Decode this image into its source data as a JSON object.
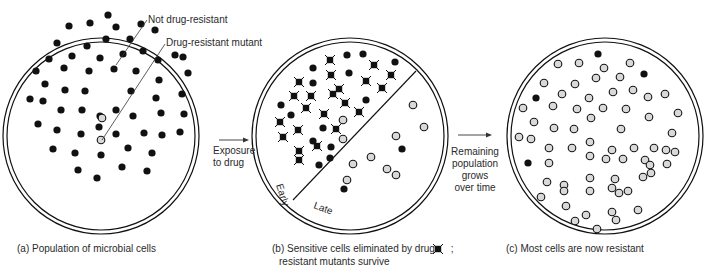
{
  "figure": {
    "panels": [
      {
        "id": "a",
        "caption": "(a) Population of microbial cells",
        "annotations": {
          "not_resistant": "Not drug-resistant",
          "resistant_mutant": "Drug-resistant mutant"
        },
        "center": [
          101,
          136
        ],
        "black_cells": [
          [
            108,
            15
          ],
          [
            69,
            26
          ],
          [
            90,
            23
          ],
          [
            116,
            27
          ],
          [
            141,
            24
          ],
          [
            155,
            30
          ],
          [
            57,
            43
          ],
          [
            87,
            46
          ],
          [
            106,
            39
          ],
          [
            130,
            39
          ],
          [
            49,
            59
          ],
          [
            72,
            56
          ],
          [
            100,
            58
          ],
          [
            123,
            54
          ],
          [
            143,
            51
          ],
          [
            158,
            60
          ],
          [
            175,
            55
          ],
          [
            36,
            71
          ],
          [
            64,
            68
          ],
          [
            89,
            71
          ],
          [
            114,
            69
          ],
          [
            136,
            71
          ],
          [
            159,
            80
          ],
          [
            188,
            73
          ],
          [
            45,
            84
          ],
          [
            65,
            90
          ],
          [
            85,
            91
          ],
          [
            131,
            91
          ],
          [
            156,
            98
          ],
          [
            182,
            94
          ],
          [
            30,
            99
          ],
          [
            43,
            101
          ],
          [
            61,
            110
          ],
          [
            82,
            110
          ],
          [
            100,
            116
          ],
          [
            116,
            110
          ],
          [
            133,
            116
          ],
          [
            161,
            113
          ],
          [
            184,
            114
          ],
          [
            38,
            124
          ],
          [
            57,
            130
          ],
          [
            81,
            134
          ],
          [
            99,
            127
          ],
          [
            116,
            134
          ],
          [
            144,
            133
          ],
          [
            162,
            135
          ],
          [
            180,
            132
          ],
          [
            53,
            149
          ],
          [
            75,
            153
          ],
          [
            101,
            155
          ],
          [
            128,
            148
          ],
          [
            152,
            153
          ],
          [
            78,
            170
          ],
          [
            122,
            167
          ],
          [
            147,
            171
          ],
          [
            97,
            178
          ],
          [
            183,
            57
          ]
        ],
        "resistant_cells": [
          [
            102,
            118
          ],
          [
            101,
            140
          ]
        ]
      },
      {
        "id": "b",
        "caption_line1": "(b) Sensitive cells eliminated by drug",
        "caption_line2": "resistant mutants survive",
        "caption_suffix": ";",
        "region_labels": {
          "early": "Early",
          "late": "Late"
        },
        "center": [
          350,
          136
        ],
        "dead_cells": [
          [
            330,
            60
          ],
          [
            374,
            65
          ],
          [
            391,
            75
          ],
          [
            331,
            75
          ],
          [
            299,
            82
          ],
          [
            366,
            81
          ],
          [
            339,
            89
          ],
          [
            382,
            88
          ],
          [
            294,
            96
          ],
          [
            311,
            96
          ],
          [
            333,
            94
          ],
          [
            345,
            103
          ],
          [
            306,
            108
          ],
          [
            324,
            114
          ],
          [
            359,
            112
          ],
          [
            280,
            122
          ],
          [
            298,
            130
          ],
          [
            336,
            129
          ],
          [
            283,
            137
          ],
          [
            299,
            151
          ],
          [
            317,
            146
          ],
          [
            299,
            160
          ]
        ],
        "black_cells": [
          [
            347,
            55
          ],
          [
            363,
            54
          ],
          [
            395,
            62
          ],
          [
            313,
            68
          ],
          [
            349,
            73
          ],
          [
            313,
            83
          ],
          [
            366,
            100
          ],
          [
            281,
            105
          ],
          [
            291,
            115
          ],
          [
            323,
            128
          ],
          [
            313,
            141
          ],
          [
            331,
            147
          ],
          [
            330,
            158
          ],
          [
            319,
            165
          ],
          [
            402,
            149
          ],
          [
            344,
            189
          ]
        ],
        "resistant_cells": [
          [
            343,
            120
          ],
          [
            343,
            139
          ],
          [
            413,
            105
          ],
          [
            424,
            127
          ],
          [
            396,
            136
          ],
          [
            371,
            157
          ],
          [
            353,
            164
          ],
          [
            387,
            169
          ],
          [
            347,
            180
          ],
          [
            396,
            175
          ]
        ]
      },
      {
        "id": "c",
        "caption": "(c) Most cells are now resistant",
        "center": [
          605,
          136
        ],
        "black_cells": [
          [
            598,
            54
          ],
          [
            644,
            74
          ],
          [
            536,
            98
          ],
          [
            528,
            163
          ]
        ],
        "resistant_cells": [
          [
            558,
            64
          ],
          [
            579,
            63
          ],
          [
            604,
            68
          ],
          [
            630,
            63
          ],
          [
            596,
            78
          ],
          [
            620,
            77
          ],
          [
            544,
            83
          ],
          [
            575,
            84
          ],
          [
            613,
            92
          ],
          [
            633,
            90
          ],
          [
            562,
            94
          ],
          [
            589,
            98
          ],
          [
            648,
            97
          ],
          [
            665,
            94
          ],
          [
            523,
            108
          ],
          [
            553,
            106
          ],
          [
            577,
            109
          ],
          [
            603,
            108
          ],
          [
            626,
            109
          ],
          [
            678,
            113
          ],
          [
            534,
            122
          ],
          [
            591,
            118
          ],
          [
            649,
            117
          ],
          [
            554,
            128
          ],
          [
            574,
            129
          ],
          [
            621,
            129
          ],
          [
            519,
            137
          ],
          [
            531,
            139
          ],
          [
            672,
            133
          ],
          [
            549,
            148
          ],
          [
            572,
            148
          ],
          [
            590,
            142
          ],
          [
            612,
            150
          ],
          [
            634,
            148
          ],
          [
            654,
            148
          ],
          [
            675,
            152
          ],
          [
            590,
            156
          ],
          [
            606,
            159
          ],
          [
            623,
            159
          ],
          [
            645,
            160
          ],
          [
            667,
            164
          ],
          [
            547,
            182
          ],
          [
            564,
            185
          ],
          [
            590,
            178
          ],
          [
            615,
            179
          ],
          [
            643,
            177
          ],
          [
            651,
            173
          ],
          [
            541,
            197
          ],
          [
            564,
            191
          ],
          [
            590,
            191
          ],
          [
            612,
            188
          ],
          [
            628,
            191
          ],
          [
            566,
            206
          ],
          [
            586,
            215
          ],
          [
            612,
            212
          ],
          [
            638,
            210
          ],
          [
            575,
            221
          ],
          [
            616,
            220
          ],
          [
            597,
            229
          ],
          [
            650,
            165
          ],
          [
            666,
            150
          ],
          [
            549,
            163
          ],
          [
            619,
            193
          ]
        ]
      }
    ],
    "arrows": [
      {
        "id": "exposure",
        "label_line1": "Exposure",
        "label_line2": "to drug"
      },
      {
        "id": "growth",
        "label_line1": "Remaining",
        "label_line2": "population",
        "label_line3": "grows",
        "label_line4": "over time"
      }
    ],
    "legend_symbol": "drug-killed-cell"
  },
  "colors": {
    "ink": "#111111",
    "resistant_fill": "#d9d9d9",
    "background": "#ffffff",
    "text": "#2a2a2a"
  }
}
